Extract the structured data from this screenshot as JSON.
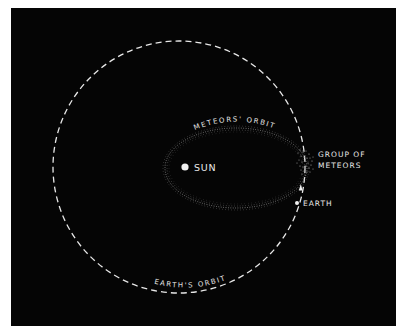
{
  "diagram": {
    "labels": {
      "sun": "SUN",
      "meteors_orbit": "METEORS' ORBIT",
      "group_of_meteors_line1": "GROUP OF",
      "group_of_meteors_line2": "METEORS",
      "earth": "EARTH",
      "earths_orbit": "EARTH'S ORBIT"
    },
    "colors": {
      "background": "#050505",
      "frame": "#ffffff",
      "foreground": "#e8e8e8"
    },
    "geometry": {
      "earths_orbit": {
        "cx": 179,
        "cy": 167,
        "r": 126,
        "style": "dashed"
      },
      "meteors_orbit": {
        "cx": 236,
        "cy": 168,
        "rx": 71,
        "ry": 40,
        "style": "dotted"
      },
      "sun": {
        "x": 185,
        "y": 167
      },
      "earth": {
        "x": 297,
        "y": 203
      },
      "meteor_group": {
        "x": 305,
        "y": 161
      },
      "direction_arrow": {
        "x": 300,
        "y": 188,
        "direction": "up"
      }
    }
  }
}
